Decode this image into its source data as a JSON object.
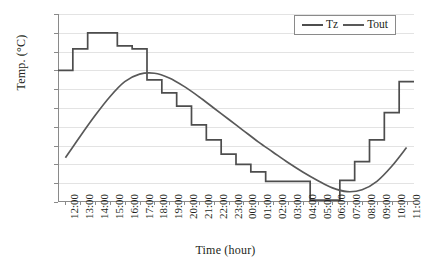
{
  "chart_data": {
    "type": "line",
    "title": "",
    "xlabel": "Time (hour)",
    "ylabel": "Temp. (°C)",
    "ylim": [
      14.0,
      34.0
    ],
    "ytick_values": [
      14.0,
      16.0,
      18.0,
      20.0,
      22.0,
      24.0,
      26.0,
      28.0,
      30.0,
      32.0,
      34.0
    ],
    "ytick_labels": [
      "14.0",
      "16.0",
      "18.0",
      "20.0",
      "22.0",
      "24.0",
      "26.0",
      "28.0",
      "30.0",
      "32.0",
      "34.0"
    ],
    "grid": true,
    "legend_position": "top-right",
    "categories": [
      "12:00",
      "13:00",
      "14:00",
      "15:00",
      "16:00",
      "17:00",
      "18:00",
      "19:00",
      "20:00",
      "21:00",
      "22:00",
      "23:00",
      "00:00",
      "01:00",
      "02:00",
      "03:00",
      "04:00",
      "05:00",
      "06:00",
      "07:00",
      "08:00",
      "09:00",
      "10:00",
      "11:00"
    ],
    "series": [
      {
        "name": "Tz",
        "style": "step",
        "color": "#4d4d4d",
        "values": [
          28.0,
          30.3,
          32.0,
          32.0,
          30.6,
          30.3,
          27.0,
          25.6,
          24.2,
          22.2,
          20.6,
          19.1,
          18.0,
          17.2,
          16.2,
          16.2,
          16.2,
          14.2,
          14.2,
          16.3,
          18.3,
          20.6,
          23.5,
          26.8
        ]
      },
      {
        "name": "Tout",
        "style": "smooth",
        "color": "#595959",
        "values": [
          18.7,
          21.0,
          23.2,
          25.2,
          26.8,
          27.6,
          27.7,
          27.2,
          26.3,
          25.2,
          24.0,
          22.8,
          21.6,
          20.4,
          19.3,
          18.2,
          17.2,
          16.3,
          15.5,
          15.1,
          15.3,
          16.2,
          17.8,
          19.8
        ]
      }
    ]
  },
  "legend": {
    "items": [
      {
        "label": "Tz"
      },
      {
        "label": "Tout"
      }
    ]
  },
  "colors": {
    "tz": "#4d4d4d",
    "tout": "#595959",
    "grid": "#e3e3e3",
    "axis": "#8a8a8a",
    "text": "#231f20"
  }
}
